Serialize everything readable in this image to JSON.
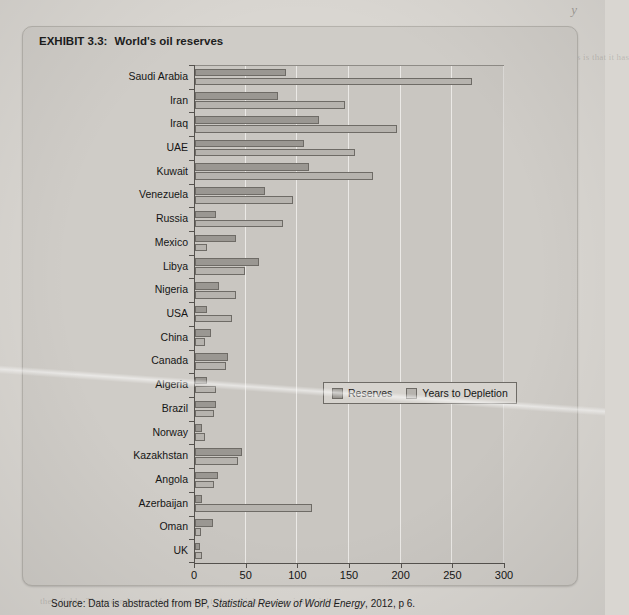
{
  "page": {
    "bleed_top_text": "y",
    "bleed_lines": [
      "their fields. The second reason for a country to have high reserves is that it has",
      "in terms of the number of years the proven reserves are expected to last.",
      "As we have seen, the world has a finite amount of oil and the total reserves",
      "are distributed unevenly across the world. This means that some countries have",
      "far more reserves than others, and the largest reserves tend to be in the Middle",
      "East. The Kazakhstan and Azerbaijan reserves, whilst smaller, are still important."
    ]
  },
  "exhibit": {
    "label": "EXHIBIT 3.3:",
    "title": "World's oil reserves"
  },
  "legend": {
    "position": "inside-plot",
    "items": [
      {
        "name": "Reserves",
        "color": "#9a9792"
      },
      {
        "name": "Years to Depletion",
        "color": "#b6b3ae"
      }
    ]
  },
  "source": {
    "prefix": "Source: Data is abstracted from BP,",
    "italic": "Statistical Review of World Energy",
    "suffix": ", 2012, p 6."
  },
  "chart_data": {
    "type": "bar",
    "orientation": "horizontal",
    "title": "World's oil reserves",
    "xlabel": "",
    "ylabel": "",
    "xlim": [
      0,
      300
    ],
    "xticks": [
      0,
      50,
      100,
      150,
      200,
      250,
      300
    ],
    "grid": true,
    "grid_axis": "x",
    "legend_position": "center-right inside plot",
    "categories": [
      "Saudi Arabia",
      "Iran",
      "Iraq",
      "UAE",
      "Kuwait",
      "Venezuela",
      "Russia",
      "Mexico",
      "Libya",
      "Nigeria",
      "USA",
      "China",
      "Canada",
      "Algeria",
      "Brazil",
      "Norway",
      "Kazakhstan",
      "Angola",
      "Azerbaijan",
      "Oman",
      "UK"
    ],
    "series": [
      {
        "name": "Reserves",
        "color": "#9a9792",
        "values": [
          88,
          80,
          120,
          105,
          110,
          68,
          20,
          40,
          62,
          23,
          12,
          15,
          32,
          12,
          20,
          7,
          45,
          22,
          7,
          17,
          5
        ]
      },
      {
        "name": "Years to Depletion",
        "color": "#b6b3ae",
        "values": [
          268,
          145,
          195,
          155,
          172,
          95,
          85,
          12,
          48,
          40,
          36,
          10,
          30,
          20,
          18,
          10,
          42,
          18,
          113,
          6,
          7
        ]
      }
    ]
  }
}
